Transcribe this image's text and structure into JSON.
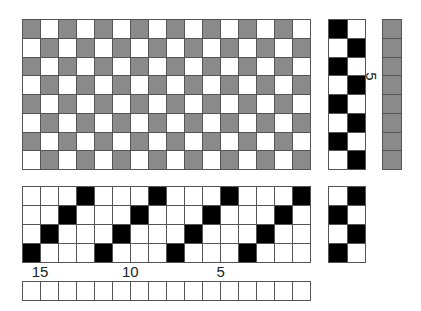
{
  "colors": {
    "warp_gray": "#8a8a8a",
    "black": "#000000",
    "white": "#ffffff"
  },
  "drawdown": {
    "cols": 16,
    "rows": 8,
    "pattern": [
      "g.g.g.g.g.g.g.g.",
      ".g.g.g.g.g.g.g.g",
      "g.g.g.g.g.g.g.g.",
      ".g.g.g.g.g.g.g.g",
      "g.g.g.g.g.g.g.g.",
      ".g.g.g.g.g.g.g.g",
      "g.g.g.g.g.g.g.g.",
      ".g.g.g.g.g.g.g.g"
    ]
  },
  "treadling": {
    "cols": 2,
    "rows": 8,
    "pattern": [
      "b.",
      ".b",
      "b.",
      ".b",
      "b.",
      ".b",
      "b.",
      ".b"
    ],
    "label": "5"
  },
  "weft_colors": {
    "rows": 8,
    "pattern": [
      "g",
      "g",
      "g",
      "g",
      "g",
      "g",
      "g",
      "g"
    ]
  },
  "threading": {
    "cols": 16,
    "rows": 4,
    "pattern": [
      "...b...b...b...b",
      "..b...b...b...b.",
      ".b...b...b...b..",
      "b...b...b...b..."
    ],
    "labels": [
      {
        "text": "15",
        "col": 1
      },
      {
        "text": "10",
        "col": 6
      },
      {
        "text": "5",
        "col": 11
      }
    ]
  },
  "tieup": {
    "cols": 2,
    "rows": 4,
    "pattern": [
      ".b",
      "b.",
      ".b",
      "b."
    ]
  },
  "warp_colors": {
    "cols": 16,
    "pattern": "................"
  }
}
